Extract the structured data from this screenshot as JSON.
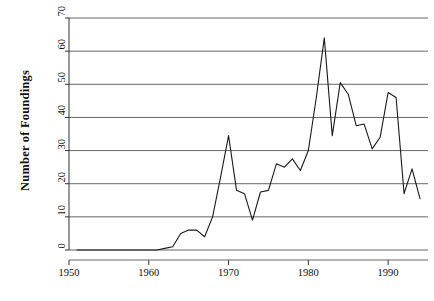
{
  "chart_data": {
    "type": "line",
    "title": "",
    "xlabel": "",
    "ylabel": "Number of Foundings",
    "xlim": [
      1950,
      1995
    ],
    "ylim": [
      0,
      70
    ],
    "xticks": [
      1950,
      1960,
      1970,
      1980,
      1990
    ],
    "xtick_labels": [
      "1950",
      "1960",
      "1970",
      "1980",
      "1990"
    ],
    "yticks": [
      0,
      10,
      20,
      30,
      40,
      50,
      60,
      70
    ],
    "ytick_labels": [
      "0",
      "10",
      "20",
      "30",
      "40",
      "50",
      "60",
      "70"
    ],
    "grid": "horizontal",
    "legend": "none",
    "line_color": "#1a1a1a",
    "grid_color": "#555555",
    "axis_color": "#333333",
    "background": "#ffffff",
    "x": [
      1951,
      1952,
      1953,
      1954,
      1955,
      1956,
      1957,
      1958,
      1959,
      1960,
      1961,
      1962,
      1963,
      1964,
      1965,
      1966,
      1967,
      1968,
      1969,
      1970,
      1971,
      1972,
      1973,
      1974,
      1975,
      1976,
      1977,
      1978,
      1979,
      1980,
      1981,
      1982,
      1983,
      1984,
      1985,
      1986,
      1987,
      1988,
      1989,
      1990,
      1991,
      1992,
      1993,
      1994
    ],
    "values": [
      0,
      0,
      0,
      0,
      0,
      0,
      0,
      0,
      0,
      0,
      0,
      0.5,
      1,
      5,
      6,
      6,
      4,
      10,
      22,
      34.5,
      18,
      17,
      9,
      17.5,
      18,
      26,
      25,
      27.5,
      24,
      30,
      46,
      64,
      34.5,
      50.5,
      47,
      37.5,
      38,
      30.5,
      34,
      47.5,
      46,
      17,
      24.5,
      15.5
    ]
  }
}
